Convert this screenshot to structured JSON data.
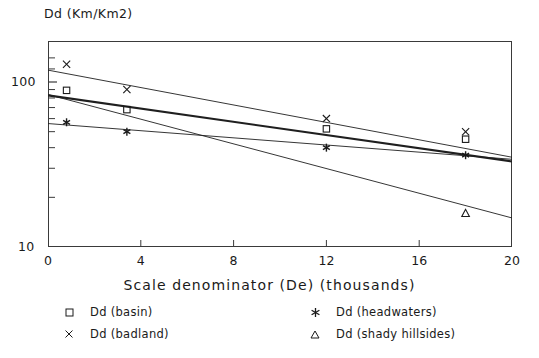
{
  "chart_data": {
    "type": "scatter",
    "title": "Dd (Km/Km2)",
    "ylabel": "Dd (Km/Km2)",
    "xlabel": "Scale denominator (De) (thousands)",
    "yscale": "log",
    "xlim": [
      0,
      20
    ],
    "ylim": [
      10,
      160
    ],
    "grid": false,
    "legend_position": "below-plot",
    "xticks": [
      "0",
      "4",
      "8",
      "12",
      "16",
      "20"
    ],
    "xtick_values": [
      0,
      4,
      8,
      12,
      16,
      20
    ],
    "yticks": [
      "100",
      "10"
    ],
    "ytick_values": [
      100,
      10
    ],
    "series": [
      {
        "name": "Dd (basin)",
        "marker": "square",
        "points": [
          {
            "x": 0.8,
            "y": 89
          },
          {
            "x": 3.4,
            "y": 68
          },
          {
            "x": 12.0,
            "y": 52
          },
          {
            "x": 18.0,
            "y": 45
          }
        ],
        "fit_line": {
          "x0": 0,
          "y0": 83,
          "x1": 20,
          "y1": 33,
          "weight": "thick"
        }
      },
      {
        "name": "Dd (badland)",
        "marker": "cross",
        "points": [
          {
            "x": 0.8,
            "y": 128
          },
          {
            "x": 3.4,
            "y": 90
          },
          {
            "x": 12.0,
            "y": 60
          },
          {
            "x": 18.0,
            "y": 50
          }
        ],
        "fit_line": {
          "x0": 0,
          "y0": 118,
          "x1": 20,
          "y1": 35,
          "weight": "thin"
        }
      },
      {
        "name": "Dd (headwaters)",
        "marker": "asterisk",
        "points": [
          {
            "x": 0.8,
            "y": 57
          },
          {
            "x": 3.4,
            "y": 50
          },
          {
            "x": 12.0,
            "y": 40
          },
          {
            "x": 18.0,
            "y": 36
          }
        ],
        "fit_line": {
          "x0": 0,
          "y0": 56,
          "x1": 20,
          "y1": 34,
          "weight": "thin"
        }
      },
      {
        "name": "Dd (shady hillsides)",
        "marker": "triangle",
        "points": [
          {
            "x": 18.0,
            "y": 16
          }
        ],
        "fit_line": {
          "x0": 0,
          "y0": 84,
          "x1": 20,
          "y1": 15,
          "weight": "thin"
        }
      }
    ]
  },
  "legend": {
    "items": [
      {
        "label": "Dd (basin)",
        "marker": "square"
      },
      {
        "label": "Dd (badland)",
        "marker": "cross"
      },
      {
        "label": "Dd (headwaters)",
        "marker": "asterisk"
      },
      {
        "label": "Dd (shady hillsides)",
        "marker": "triangle"
      }
    ]
  },
  "colors": {
    "ink": "#1a1a1a",
    "background": "#ffffff",
    "line": "#2b2b2b"
  }
}
